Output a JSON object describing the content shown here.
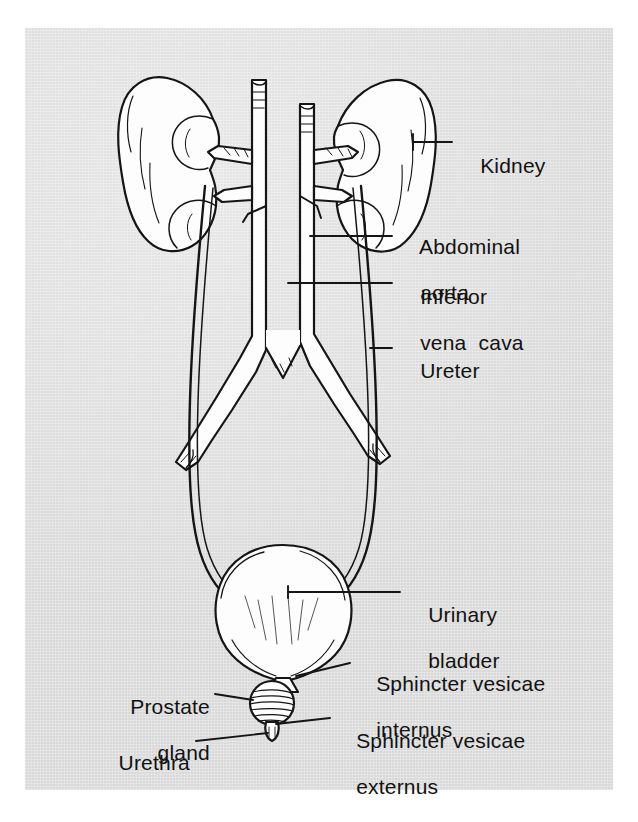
{
  "figure": {
    "background_color": "#d9d9d9",
    "ink_color": "#151515",
    "organ_fill": "#fdfdfd"
  },
  "labels": [
    {
      "id": "kidney",
      "text": "Kidney",
      "line2": ""
    },
    {
      "id": "abdominal-aorta",
      "text": "Abdominal",
      "line2": "aorta"
    },
    {
      "id": "inferior-vena-cava",
      "text": "Inferior",
      "line2": "vena  cava"
    },
    {
      "id": "ureter",
      "text": "Ureter",
      "line2": ""
    },
    {
      "id": "urinary-bladder",
      "text": "Urinary",
      "line2": "bladder"
    },
    {
      "id": "sphincter-internus",
      "text": "Sphincter vesicae",
      "line2": "internus"
    },
    {
      "id": "sphincter-externus",
      "text": "Sphincter vesicae",
      "line2": "externus"
    },
    {
      "id": "prostate-gland",
      "text": "Prostate",
      "line2": "gland"
    },
    {
      "id": "urethra",
      "text": "Urethra",
      "line2": ""
    }
  ],
  "structures": [
    {
      "id": "left-kidney",
      "name": "Kidney"
    },
    {
      "id": "right-kidney",
      "name": "Kidney"
    },
    {
      "id": "aorta",
      "name": "Abdominal aorta"
    },
    {
      "id": "vena-cava",
      "name": "Inferior vena cava"
    },
    {
      "id": "left-ureter",
      "name": "Ureter"
    },
    {
      "id": "right-ureter",
      "name": "Ureter"
    },
    {
      "id": "bladder",
      "name": "Urinary bladder"
    },
    {
      "id": "prostate",
      "name": "Prostate gland"
    },
    {
      "id": "urethra-tube",
      "name": "Urethra"
    }
  ]
}
